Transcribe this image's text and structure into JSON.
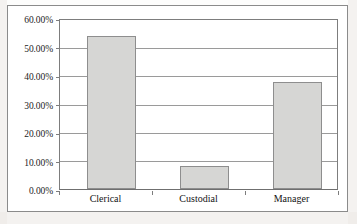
{
  "chart_data": {
    "type": "bar",
    "title": "",
    "subtitle": "",
    "xlabel": "",
    "ylabel": "",
    "categories": [
      "Clerical",
      "Custodial",
      "Manager"
    ],
    "values": [
      54.4,
      8.1,
      37.9
    ],
    "value_format": "percent",
    "ylim": [
      0,
      60
    ],
    "ytick_values": [
      0,
      10,
      20,
      30,
      40,
      50,
      60
    ],
    "ytick_labels": [
      "0.00%",
      "10.00%",
      "20.00%",
      "30.00%",
      "40.00%",
      "50.00%",
      "60.00%"
    ],
    "grid": true,
    "grid_axis": "y",
    "legend": false,
    "legend_position": "none",
    "series": [
      {
        "name": "Percent",
        "values": [
          54.4,
          8.1,
          37.9
        ],
        "bar_fill_color": "#d6d6d4",
        "bar_border_color": "#8e8e8e"
      }
    ],
    "colors": {
      "bar_fill": "#d6d6d4",
      "bar_border": "#8e8e8e",
      "gridline": "#9a9a9a",
      "axis": "#7d7d7d",
      "frame": "#8b8b8b",
      "plot_background": "#ffffff",
      "text": "#1d1d1d"
    }
  }
}
